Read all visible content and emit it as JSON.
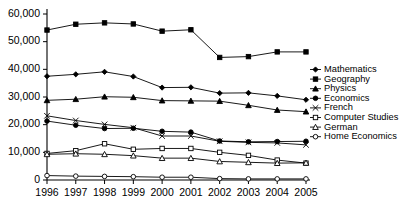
{
  "chart_data": {
    "type": "line",
    "title": "",
    "xlabel": "",
    "ylabel": "",
    "categories": [
      "1996",
      "1997",
      "1998",
      "1999",
      "2000",
      "2001",
      "2002",
      "2003",
      "2004",
      "2005"
    ],
    "ylim": [
      0,
      60000
    ],
    "yticks": [
      0,
      10000,
      20000,
      30000,
      40000,
      50000,
      60000
    ],
    "ytick_labels": [
      "0",
      "10,000",
      "20,000",
      "30,000",
      "40,000",
      "50,000",
      "60,000"
    ],
    "grid": false,
    "legend_position": "right",
    "series": [
      {
        "name": "Mathematics",
        "marker": "diamond-filled",
        "values": [
          37500,
          38200,
          39100,
          37400,
          33400,
          33500,
          31400,
          31500,
          30400,
          29000
        ]
      },
      {
        "name": "Geography",
        "marker": "square-filled",
        "values": [
          54200,
          56300,
          56800,
          56400,
          53800,
          54300,
          44300,
          44600,
          46300,
          46300
        ]
      },
      {
        "name": "Physics",
        "marker": "triangle-filled",
        "values": [
          28800,
          29200,
          30100,
          29900,
          28700,
          28600,
          28500,
          27000,
          25300,
          24700
        ]
      },
      {
        "name": "Economics",
        "marker": "circle-filled",
        "values": [
          21300,
          19800,
          18600,
          18700,
          17600,
          17300,
          14100,
          13800,
          13900,
          14000
        ]
      },
      {
        "name": "French",
        "marker": "cross",
        "values": [
          23200,
          21500,
          20100,
          18900,
          15900,
          15900,
          14000,
          13600,
          13400,
          12700
        ]
      },
      {
        "name": "Computer Studies",
        "marker": "square-open",
        "values": [
          9600,
          10600,
          13100,
          11100,
          11400,
          11400,
          10000,
          8900,
          7200,
          6100
        ]
      },
      {
        "name": "German",
        "marker": "triangle-open",
        "values": [
          9300,
          9500,
          9300,
          8800,
          7900,
          7900,
          6700,
          6400,
          6100,
          6200
        ]
      },
      {
        "name": "Home Economics",
        "marker": "circle-open",
        "values": [
          1600,
          1400,
          1300,
          1200,
          1000,
          1000,
          500,
          400,
          400,
          400
        ]
      }
    ]
  }
}
